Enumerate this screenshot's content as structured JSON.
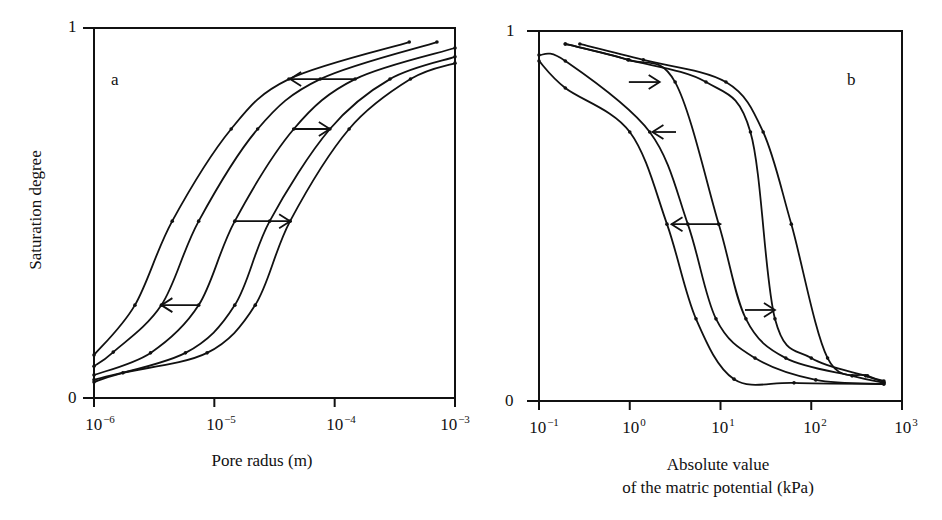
{
  "figure": {
    "y_axis_label": "Saturation degree",
    "panel_a": {
      "letter": "a",
      "x_axis_label": "Pore radus (m)",
      "y_ticks": [
        "1",
        "0"
      ],
      "x_ticks": [
        {
          "base": "10",
          "exp": "−6"
        },
        {
          "base": "10",
          "exp": "−5"
        },
        {
          "base": "10",
          "exp": "−4"
        },
        {
          "base": "10",
          "exp": "−3"
        }
      ]
    },
    "panel_b": {
      "letter": "b",
      "x_axis_label_line1": "Absolute value",
      "x_axis_label_line2": "of the matric potential (kPa)",
      "y_ticks": [
        "1",
        "0"
      ],
      "x_ticks": [
        {
          "base": "10",
          "exp": "−1"
        },
        {
          "base": "10",
          "exp": "0"
        },
        {
          "base": "10",
          "exp": "1"
        },
        {
          "base": "10",
          "exp": "2"
        },
        {
          "base": "10",
          "exp": "3"
        }
      ]
    },
    "line_color": "#111111"
  },
  "chart_data": [
    {
      "type": "line",
      "title": "a",
      "xlabel": "Pore radus (m)",
      "ylabel": "Saturation degree",
      "xscale": "log",
      "xlim": [
        1e-06,
        0.001
      ],
      "ylim": [
        0,
        1
      ],
      "grid": false,
      "legend": null,
      "series": [
        {
          "name": "curve 1",
          "log10_x": [
            -6.0,
            -5.66,
            -5.35,
            -4.86,
            -4.38,
            -3.38
          ],
          "y": [
            0.116,
            0.251,
            0.478,
            0.727,
            0.862,
            0.962
          ]
        },
        {
          "name": "curve 2",
          "log10_x": [
            -6.0,
            -5.84,
            -5.44,
            -5.13,
            -4.64,
            -4.12,
            -3.15
          ],
          "y": [
            0.086,
            0.124,
            0.251,
            0.478,
            0.727,
            0.862,
            0.962
          ]
        },
        {
          "name": "curve 3",
          "log10_x": [
            -6.0,
            -5.53,
            -5.13,
            -4.83,
            -4.34,
            -3.83,
            -3.0
          ],
          "y": [
            0.062,
            0.122,
            0.251,
            0.478,
            0.727,
            0.862,
            0.946
          ]
        },
        {
          "name": "curve 4",
          "log10_x": [
            -6.0,
            -5.24,
            -4.83,
            -4.54,
            -4.04,
            -3.54,
            -3.0
          ],
          "y": [
            0.049,
            0.122,
            0.251,
            0.478,
            0.727,
            0.862,
            0.922
          ]
        },
        {
          "name": "curve 5",
          "log10_x": [
            -6.0,
            -5.76,
            -5.06,
            -4.66,
            -4.37,
            -3.88,
            -3.37,
            -3.0
          ],
          "y": [
            0.043,
            0.068,
            0.122,
            0.251,
            0.478,
            0.727,
            0.862,
            0.905
          ]
        }
      ],
      "arrows": [
        {
          "from_log10_x": -3.83,
          "to_log10_x": -4.37,
          "y": 0.862,
          "direction": "left"
        },
        {
          "from_log10_x": -4.35,
          "to_log10_x": -4.04,
          "y": 0.727,
          "direction": "right"
        },
        {
          "from_log10_x": -4.83,
          "to_log10_x": -4.37,
          "y": 0.478,
          "direction": "right"
        },
        {
          "from_log10_x": -5.14,
          "to_log10_x": -5.44,
          "y": 0.251,
          "direction": "left"
        }
      ]
    },
    {
      "type": "line",
      "title": "b",
      "xlabel": "Absolute value of the matric potential (kPa)",
      "ylabel": "Saturation degree",
      "xscale": "log",
      "xlim": [
        0.1,
        1000
      ],
      "ylim": [
        0,
        1
      ],
      "grid": false,
      "legend": null,
      "series": [
        {
          "name": "curve 1",
          "log10_x": [
            -1.0,
            -0.71,
            0.0,
            0.41,
            0.73,
            1.15,
            1.81,
            2.8
          ],
          "y": [
            0.919,
            0.846,
            0.727,
            0.478,
            0.222,
            0.059,
            0.049,
            0.046
          ]
        },
        {
          "name": "curve 2",
          "log10_x": [
            -1.0,
            -0.71,
            0.22,
            0.64,
            0.95,
            1.38,
            2.05,
            2.8
          ],
          "y": [
            0.935,
            0.919,
            0.727,
            0.478,
            0.222,
            0.116,
            0.057,
            0.046
          ]
        },
        {
          "name": "curve 3",
          "log10_x": [
            -0.71,
            -0.02,
            0.5,
            0.98,
            1.28,
            1.72,
            2.45,
            2.8
          ],
          "y": [
            0.965,
            0.922,
            0.862,
            0.478,
            0.222,
            0.116,
            0.068,
            0.049
          ]
        },
        {
          "name": "curve 4",
          "log10_x": [
            -0.71,
            -0.01,
            0.84,
            1.33,
            1.6,
            2.0,
            2.6,
            2.8
          ],
          "y": [
            0.965,
            0.922,
            0.862,
            0.727,
            0.222,
            0.116,
            0.068,
            0.051
          ]
        },
        {
          "name": "curve 5",
          "log10_x": [
            -0.55,
            0.15,
            1.06,
            1.47,
            1.78,
            2.18,
            2.62,
            2.8
          ],
          "y": [
            0.965,
            0.922,
            0.862,
            0.727,
            0.478,
            0.116,
            0.068,
            0.054
          ]
        }
      ],
      "arrows": [
        {
          "from_log10_x": -0.01,
          "to_log10_x": 0.33,
          "y": 0.862,
          "direction": "right"
        },
        {
          "from_log10_x": 0.51,
          "to_log10_x": 0.25,
          "y": 0.727,
          "direction": "left"
        },
        {
          "from_log10_x": 1.01,
          "to_log10_x": 0.46,
          "y": 0.478,
          "direction": "left"
        },
        {
          "from_log10_x": 1.27,
          "to_log10_x": 1.6,
          "y": 0.246,
          "direction": "right"
        }
      ]
    }
  ]
}
